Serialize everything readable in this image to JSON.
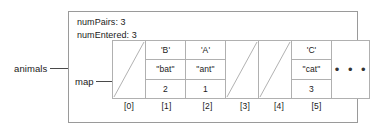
{
  "diagram": {
    "external_pointer": {
      "label": "animals",
      "arrow": "right-arrow-icon"
    },
    "object": {
      "fields": [
        {
          "name": "numPairs",
          "text": "numPairs: 3"
        },
        {
          "name": "numEntered",
          "text": "numEntered: 3"
        }
      ],
      "map_pointer": {
        "label": "map",
        "arrow": "right-arrow-icon"
      },
      "array": {
        "row_labels": [
          "key",
          "value",
          "count"
        ],
        "cells": [
          {
            "index": "[0]",
            "state": "empty",
            "key": "",
            "value": "",
            "count": ""
          },
          {
            "index": "[1]",
            "state": "filled",
            "key": "'B'",
            "value": "\"bat\"",
            "count": "2"
          },
          {
            "index": "[2]",
            "state": "filled",
            "key": "'A'",
            "value": "\"ant\"",
            "count": "1"
          },
          {
            "index": "[3]",
            "state": "empty",
            "key": "",
            "value": "",
            "count": ""
          },
          {
            "index": "[4]",
            "state": "empty",
            "key": "",
            "value": "",
            "count": ""
          },
          {
            "index": "[5]",
            "state": "filled",
            "key": "'C'",
            "value": "\"cat\"",
            "count": "3"
          }
        ],
        "continuation": "• • •"
      }
    },
    "colors": {
      "box_border": "#9a9a9a",
      "cell_border": "#b0b0b0",
      "text": "#1a1a1a",
      "arrow": "#3a3a3a",
      "background": "#ffffff"
    }
  }
}
